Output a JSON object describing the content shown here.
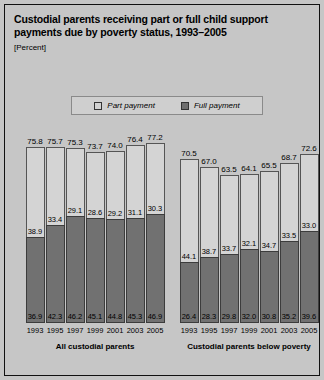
{
  "title": "Custodial parents receiving part or full child support payments due by poverty status, 1993–2005",
  "subtitle": "[Percent]",
  "legend": [
    {
      "label": "Part payment",
      "color": "#d4d4d4",
      "key": "part"
    },
    {
      "label": "Full payment",
      "color": "#717171",
      "key": "full"
    }
  ],
  "panels": [
    {
      "caption": "All custodial parents"
    },
    {
      "caption": "Custodial parents below poverty"
    }
  ],
  "chart_data": {
    "type": "bar",
    "title": "Custodial parents receiving part or full child support payments due by poverty status, 1993–2005",
    "subtitle": "[Percent]",
    "xlabel": "",
    "ylabel": "Percent",
    "ylim": [
      0,
      80
    ],
    "grid": false,
    "legend_position": "top-center",
    "stacked": true,
    "categories": [
      "1993",
      "1995",
      "1997",
      "1999",
      "2001",
      "2003",
      "2005"
    ],
    "panels": [
      {
        "name": "All custodial parents",
        "series": [
          {
            "name": "Full payment",
            "values": [
              36.9,
              42.3,
              46.2,
              45.1,
              44.8,
              45.3,
              46.9
            ]
          },
          {
            "name": "Part payment",
            "values": [
              38.9,
              33.4,
              29.1,
              28.6,
              29.2,
              31.1,
              30.3
            ]
          }
        ],
        "totals": [
          75.8,
          75.7,
          75.3,
          73.7,
          74.0,
          76.4,
          77.2
        ]
      },
      {
        "name": "Custodial parents below poverty",
        "series": [
          {
            "name": "Full payment",
            "values": [
              26.4,
              28.3,
              29.8,
              32.0,
              30.8,
              35.2,
              39.6
            ]
          },
          {
            "name": "Part payment",
            "values": [
              44.1,
              38.7,
              33.7,
              32.1,
              34.7,
              33.5,
              33.0
            ]
          }
        ],
        "totals": [
          70.5,
          67.0,
          63.5,
          64.1,
          65.5,
          68.7,
          72.6
        ]
      }
    ]
  }
}
